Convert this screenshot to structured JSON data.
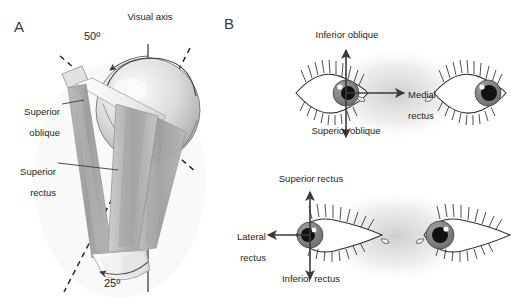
{
  "figure": {
    "type": "anatomical-diagram",
    "background_color": "#ffffff",
    "ink_color": "#231f20",
    "muscle_color": "#a6a6a6",
    "iris_color": "#8c8c8c",
    "pupil_color": "#111111"
  },
  "panels": {
    "a": {
      "label": "A",
      "description": "Oblique three-dimensional view of the right orbit showing the superior oblique and superior rectus muscles relative to the visual axis",
      "axis_label": "Visual axis",
      "angles": [
        {
          "name": "superior-oblique-angle",
          "value": "50º"
        },
        {
          "name": "superior-rectus-angle",
          "value": "25º"
        }
      ],
      "muscle_labels": [
        {
          "name": "superior-oblique",
          "line1": "Superior",
          "line2": "oblique"
        },
        {
          "name": "superior-rectus",
          "line1": "Superior",
          "line2": "rectus"
        }
      ]
    },
    "b": {
      "label": "B",
      "description": "Two pairs of eyes with arrows showing the direction of pull of the extraocular muscles",
      "rows": [
        {
          "name": "upper-eye-pair",
          "arrows": [
            {
              "name": "inferior-oblique-arrow",
              "direction": "up",
              "label": "Inferior oblique"
            },
            {
              "name": "superior-oblique-arrow",
              "direction": "down",
              "label": "Superior oblique"
            },
            {
              "name": "medial-rectus-arrow",
              "direction": "right",
              "label_line1": "Medial",
              "label_line2": "rectus"
            }
          ],
          "left_eye": {
            "name": "left-eye-medial-gaze",
            "gaze": "medial"
          },
          "right_eye": {
            "name": "right-eye-medial-gaze",
            "gaze": "lateral"
          }
        },
        {
          "name": "lower-eye-pair",
          "arrows": [
            {
              "name": "superior-rectus-arrow",
              "direction": "up",
              "label": "Superior rectus"
            },
            {
              "name": "inferior-rectus-arrow",
              "direction": "down",
              "label": "Inferior rectus"
            },
            {
              "name": "lateral-rectus-arrow",
              "direction": "left",
              "label_line1": "Lateral",
              "label_line2": "rectus"
            }
          ],
          "left_eye": {
            "name": "left-eye-lateral-gaze",
            "gaze": "lateral"
          },
          "right_eye": {
            "name": "right-eye-lateral-gaze",
            "gaze": "medial"
          }
        }
      ]
    }
  }
}
